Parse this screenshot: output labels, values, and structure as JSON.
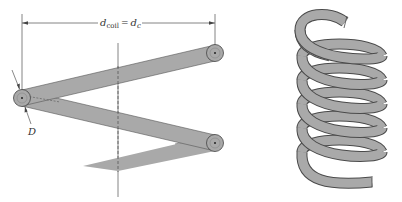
{
  "figure": {
    "left_panel": {
      "dimension_label": {
        "main_symbol": "d",
        "main_subscript": "coil",
        "equals": "=",
        "alt_symbol": "d",
        "alt_subscript": "c"
      },
      "wire_diameter_label": "D",
      "description": "Helical spring coil geometry with coil diameter and wire diameter"
    },
    "right_panel": {
      "description": "Helical compression spring",
      "turns": 6
    },
    "colors": {
      "wire_fill": "#a9a9a9",
      "wire_stroke": "#4a4a4a",
      "line": "#555555",
      "text": "#333333",
      "background": "#ffffff"
    }
  }
}
